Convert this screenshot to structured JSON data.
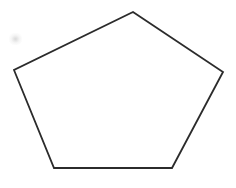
{
  "canvas": {
    "width": 236,
    "height": 188,
    "background_color": "#ffffff"
  },
  "figure": {
    "name": "pentagon",
    "shape_type": "polygon",
    "sides": 5,
    "label": "Regular pentagon outline",
    "stroke_color": "#2b2b2b",
    "fill_color": "#ffffff",
    "stroke_width": 1.8,
    "vertices": [
      {
        "name": "apex",
        "x": 133,
        "y": 12
      },
      {
        "name": "right",
        "x": 223,
        "y": 72
      },
      {
        "name": "bottom-right",
        "x": 172,
        "y": 168
      },
      {
        "name": "bottom-left",
        "x": 54,
        "y": 168
      },
      {
        "name": "left",
        "x": 14,
        "y": 70
      }
    ],
    "points_attr": "133,12 223,72 172,168 54,168 14,70"
  },
  "artifacts": {
    "smudge": {
      "name": "gray-smudge",
      "color": "#bababa",
      "x": 9,
      "y": 33,
      "width": 13,
      "height": 12
    }
  }
}
